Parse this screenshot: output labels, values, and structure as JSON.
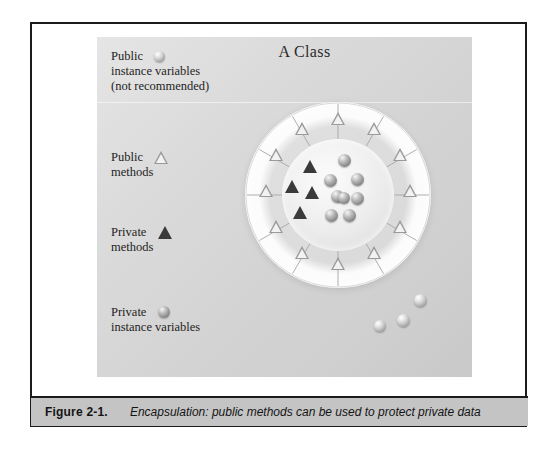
{
  "figure": {
    "caption_label": "Figure  2-1.",
    "caption_text": "Encapsulation: public methods can be used to protect private data"
  },
  "illustration": {
    "title": "A Class",
    "legend": [
      {
        "id": "public-instance-variables",
        "line1": "Public",
        "line2": "instance variables",
        "line3": "(not recommended)",
        "symbol": "light-sphere"
      },
      {
        "id": "public-methods",
        "line1": "Public",
        "line2": "methods",
        "line3": "",
        "symbol": "open-triangle"
      },
      {
        "id": "private-methods",
        "line1": "Private",
        "line2": "methods",
        "line3": "",
        "symbol": "filled-triangle"
      },
      {
        "id": "private-instance-variables",
        "line1": "Private",
        "line2": "instance variables",
        "line3": "",
        "symbol": "dark-sphere"
      }
    ],
    "diagram": {
      "outer_ring_segments": 12,
      "outer_ring_symbol": "open-triangle",
      "inner_core_triangles": 4,
      "inner_core_spheres": 8,
      "escaped_spheres": 3
    }
  },
  "colors": {
    "panel_background": "#dcdcdc",
    "caption_background": "#c4c4c4",
    "frame_border": "#1b1b1b",
    "text": "#1e1e1e"
  }
}
